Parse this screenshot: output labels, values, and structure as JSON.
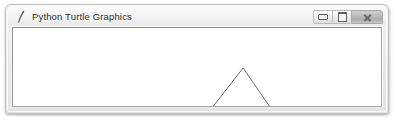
{
  "window": {
    "title": "Python Turtle Graphics",
    "icon": "python-feather-icon",
    "frame_color": "#eaeaea",
    "titlebar_text_color": "#2b2b2b",
    "controls": [
      {
        "name": "minimize-button",
        "label": "Minimize",
        "glyph": "minimize-icon"
      },
      {
        "name": "maximize-button",
        "label": "Maximize",
        "glyph": "maximize-icon"
      },
      {
        "name": "close-button",
        "label": "Close",
        "glyph": "close-icon"
      }
    ]
  },
  "canvas": {
    "background": "#ffffff",
    "pen_color": "#5a5a5a",
    "turtle_color": "#1a1a1a",
    "width": 368,
    "height": 78,
    "drawing": {
      "type": "polyline",
      "shape": "triangle",
      "description": "Equilateral triangle drawn by turtle, turtle arrow resting at bottom-left vertex heading left (180 degrees)",
      "points": "192,89 230,40 264,89 192,89",
      "turtle": {
        "x": 192,
        "y": 89,
        "heading": 180,
        "shape": "arrow"
      }
    }
  }
}
